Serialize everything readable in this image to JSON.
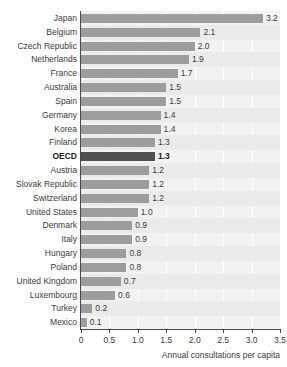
{
  "chart_data": {
    "type": "bar",
    "orientation": "horizontal",
    "title": "",
    "title_fragment": "",
    "xlabel": "Annual consultations per capita",
    "ylabel": "",
    "xlim": [
      0,
      3.5
    ],
    "xticks": [
      "0",
      "0.5",
      "1.0",
      "1.5",
      "2.0",
      "2.5",
      "3.0",
      "3.5"
    ],
    "xtick_values": [
      0,
      0.5,
      1.0,
      1.5,
      2.0,
      2.5,
      3.0,
      3.5
    ],
    "grid": "vertical",
    "legend": "none",
    "highlight_category": "OECD",
    "colors": {
      "bar": "#9d9d9d",
      "bar_highlight": "#4f4f4f",
      "plot_background": "#f2f2f2",
      "row_band_alt": "#ebebeb",
      "axis": "#4a4a4a",
      "text": "#3b3b3b"
    },
    "categories": [
      "Japan",
      "Belgium",
      "Czech Republic",
      "Netherlands",
      "France",
      "Australia",
      "Spain",
      "Germany",
      "Korea",
      "Finland",
      "OECD",
      "Austria",
      "Slovak Republic",
      "Switzerland",
      "United States",
      "Denmark",
      "Italy",
      "Hungary",
      "Poland",
      "United Kingdom",
      "Luxembourg",
      "Turkey",
      "Mexico"
    ],
    "values": [
      3.2,
      2.1,
      2.0,
      1.9,
      1.7,
      1.5,
      1.5,
      1.4,
      1.4,
      1.3,
      1.3,
      1.2,
      1.2,
      1.2,
      1.0,
      0.9,
      0.9,
      0.8,
      0.8,
      0.7,
      0.6,
      0.2,
      0.1
    ],
    "value_labels": [
      "3.2",
      "2.1",
      "2.0",
      "1.9",
      "1.7",
      "1.5",
      "1.5",
      "1.4",
      "1.4",
      "1.3",
      "1.3",
      "1.2",
      "1.2",
      "1.2",
      "1.0",
      "0.9",
      "0.9",
      "0.8",
      "0.8",
      "0.7",
      "0.6",
      "0.2",
      "0.1"
    ]
  }
}
